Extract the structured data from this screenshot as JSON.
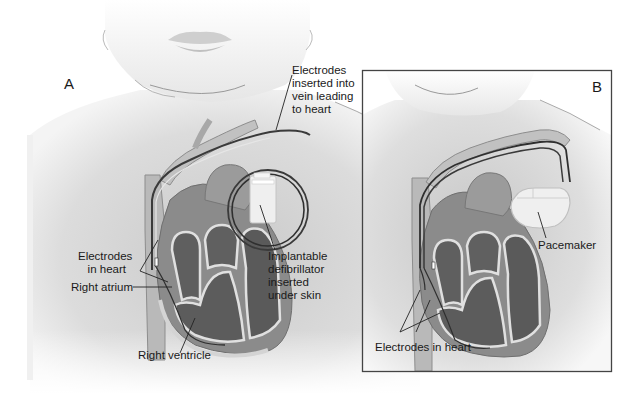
{
  "figure": {
    "panels": [
      {
        "id": "A",
        "letter": "A",
        "device": "Implantable defibrillator",
        "labels": {
          "electrodes_vein": "Electrodes\ninserted into\nvein leading\nto heart",
          "electrodes_heart": "Electrodes\n   in heart",
          "right_atrium": "Right atrium",
          "defibrillator": "Implantable\ndefibrillator\ninserted\nunder skin",
          "right_ventricle": "Right ventricle"
        }
      },
      {
        "id": "B",
        "letter": "B",
        "device": "Pacemaker",
        "labels": {
          "pacemaker": "Pacemaker",
          "electrodes_heart": "Electrodes in heart"
        }
      }
    ],
    "colors": {
      "skin": "#e2e2e2",
      "skin_shadow": "#cfcfcf",
      "heart_wall": "#8a8a8a",
      "heart_chamber": "#5e5e5e",
      "heart_lining": "#d8d8d8",
      "vessel": "#b8b8b8",
      "lead": "#3a3a3a",
      "device": "#ececec",
      "box_border": "#444444",
      "text": "#1a1a1a"
    }
  }
}
